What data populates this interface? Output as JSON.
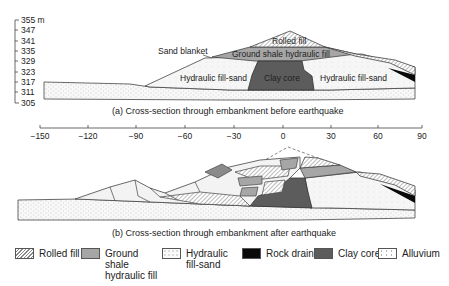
{
  "section_a": {
    "caption": "(a) Cross-section through embankment before earthquake",
    "y_axis": {
      "unit": "m",
      "ticks": [
        "355 m",
        "347",
        "341",
        "335",
        "329",
        "323",
        "317",
        "311",
        "305"
      ]
    },
    "labels": {
      "rolled_fill": "Rolled fill",
      "ground_shale": "Ground shale hydraulic fill",
      "sand_blanket": "Sand blanket",
      "hfs_left": "Hydraulic fill-sand",
      "clay_core": "Clay core",
      "hfs_right": "Hydraulic fill-sand"
    }
  },
  "x_axis": {
    "ticks": [
      "−150",
      "−120",
      "−90",
      "−60",
      "−30",
      "0",
      "30",
      "60",
      "90"
    ]
  },
  "section_b": {
    "caption": "(b) Cross-section through embankment after earthquake"
  },
  "legend": [
    {
      "label": "Rolled fill",
      "swatch": "hatched"
    },
    {
      "label": "Ground shale hydraulic fill",
      "swatch": "grey"
    },
    {
      "label": "Hydraulic fill-sand",
      "swatch": "light-dotted"
    },
    {
      "label": "Rock drain",
      "swatch": "black"
    },
    {
      "label": "Clay core",
      "swatch": "dark-grey"
    },
    {
      "label": "Alluvium",
      "swatch": "dotted"
    }
  ],
  "colors": {
    "rolled_fill": "#ffffff",
    "ground_shale": "#a6a6a6",
    "hydraulic_fill_sand": "#f4f4f4",
    "rock_drain": "#0a0a0a",
    "clay_core": "#5c5c5c",
    "alluvium": "#f7f7f7"
  }
}
